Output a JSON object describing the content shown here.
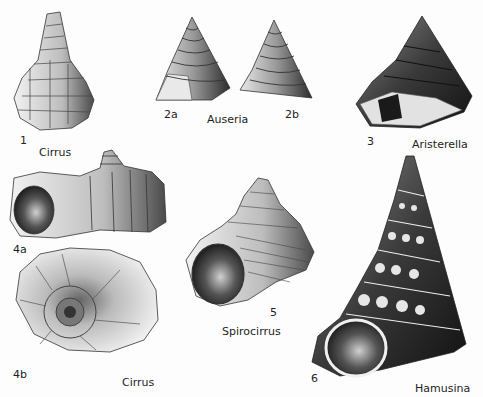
{
  "plate": {
    "figures": [
      {
        "number": "1",
        "genus": "Cirrus",
        "view": "side"
      },
      {
        "number": "2a",
        "genus": "Auseria",
        "view": "apertural"
      },
      {
        "number": "2b",
        "genus": "Auseria",
        "view": "side"
      },
      {
        "number": "3",
        "genus": "Aristerella",
        "view": "side"
      },
      {
        "number": "4a",
        "genus": "Cirrus",
        "view": "side"
      },
      {
        "number": "4b",
        "genus": "Cirrus",
        "view": "basal"
      },
      {
        "number": "5",
        "genus": "Spirocirrus",
        "view": "apertural"
      },
      {
        "number": "6",
        "genus": "Hamusina",
        "view": "apertural"
      }
    ],
    "labels": {
      "fig1_num": "1",
      "fig1_genus": "Cirrus",
      "fig2a_num": "2a",
      "fig2b_num": "2b",
      "fig2_genus": "Auseria",
      "fig3_num": "3",
      "fig3_genus": "Aristerella",
      "fig4a_num": "4a",
      "fig4b_num": "4b",
      "fig4_genus": "Cirrus",
      "fig5_num": "5",
      "fig5_genus": "Spirocirrus",
      "fig6_num": "6",
      "fig6_genus": "Hamusina"
    }
  }
}
